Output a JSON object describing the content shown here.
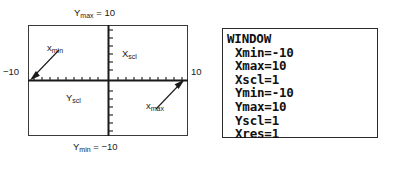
{
  "figure": {
    "graph": {
      "name": "viewing-window-diagram",
      "top_label": "Y",
      "top_label_sub": "max",
      "top_label_value": " = 10",
      "bottom_label": "Y",
      "bottom_label_sub": "min",
      "bottom_label_value": " = −10",
      "left_axis_value": "−10",
      "right_axis_value": "10",
      "xmin_callout": "x",
      "xmin_callout_sub": "min",
      "xmax_callout": "x",
      "xmax_callout_sub": "max",
      "xscl_label": "X",
      "xscl_label_sub": "scl",
      "yscl_label": "Y",
      "yscl_label_sub": "scl",
      "border_color": "#3a3a3a",
      "axis_color": "#1a1a1a"
    },
    "calculator": {
      "name": "window-settings-screen",
      "title": "WINDOW",
      "settings": [
        {
          "label": "Xmin",
          "value": "-10",
          "text": "Xmin=-10"
        },
        {
          "label": "Xmax",
          "value": "10",
          "text": "Xmax=10"
        },
        {
          "label": "Xscl",
          "value": "1",
          "text": "Xscl=1"
        },
        {
          "label": "Ymin",
          "value": "-10",
          "text": "Ymin=-10"
        },
        {
          "label": "Ymax",
          "value": "10",
          "text": "Ymax=10"
        },
        {
          "label": "Yscl",
          "value": "1",
          "text": "Yscl=1"
        },
        {
          "label": "Xres",
          "value": "1",
          "text": "Xres=1"
        }
      ],
      "border_color": "#2b2b2b",
      "text_color": "#111111"
    }
  }
}
